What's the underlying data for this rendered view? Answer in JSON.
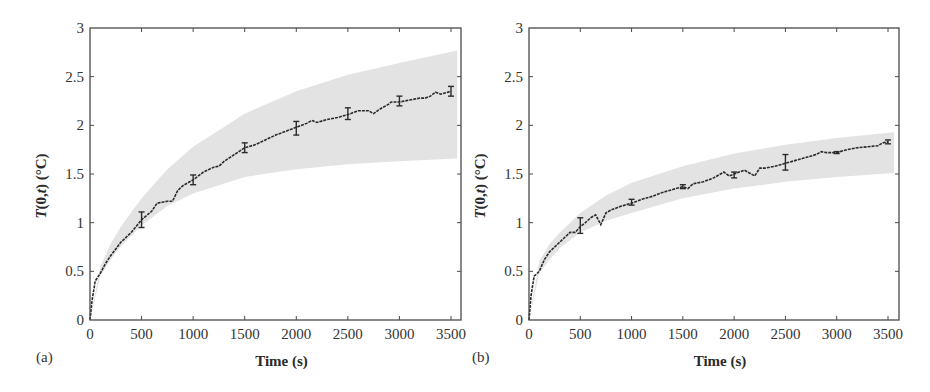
{
  "figure": {
    "panels": [
      "(a)",
      "(b)"
    ]
  },
  "chart_data": [
    {
      "type": "line",
      "panel_label": "(a)",
      "title": "",
      "xlabel": "Time (s)",
      "ylabel": "T(0,t) (°C)",
      "xlim": [
        0,
        3560
      ],
      "ylim": [
        0,
        3
      ],
      "xticks": [
        0,
        500,
        1000,
        1500,
        2000,
        2500,
        3000,
        3500
      ],
      "yticks": [
        0,
        0.5,
        1,
        1.5,
        2,
        2.5,
        3
      ],
      "ytick_labels": [
        "0",
        "0.5",
        "1",
        "1.5",
        "2",
        "2.5",
        "3"
      ],
      "grid": false,
      "legend": null,
      "series": [
        {
          "name": "measured mean",
          "style": "dashed black",
          "x": [
            0,
            20,
            50,
            100,
            150,
            200,
            300,
            400,
            500,
            600,
            650,
            700,
            750,
            800,
            850,
            900,
            1000,
            1100,
            1200,
            1250,
            1300,
            1400,
            1500,
            1600,
            1700,
            1800,
            1900,
            2000,
            2100,
            2150,
            2200,
            2300,
            2400,
            2500,
            2600,
            2700,
            2750,
            2800,
            2900,
            2920,
            3000,
            3100,
            3200,
            3250,
            3300,
            3350,
            3400,
            3500
          ],
          "y": [
            0,
            0.2,
            0.4,
            0.48,
            0.58,
            0.66,
            0.8,
            0.9,
            1.03,
            1.12,
            1.2,
            1.21,
            1.22,
            1.22,
            1.33,
            1.38,
            1.44,
            1.52,
            1.57,
            1.58,
            1.63,
            1.7,
            1.77,
            1.8,
            1.85,
            1.9,
            1.94,
            1.98,
            2.02,
            2.05,
            2.03,
            2.06,
            2.08,
            2.11,
            2.15,
            2.15,
            2.12,
            2.16,
            2.22,
            2.24,
            2.24,
            2.26,
            2.28,
            2.28,
            2.3,
            2.34,
            2.32,
            2.35
          ]
        },
        {
          "name": "uncertainty band (upper)",
          "x": [
            0,
            100,
            200,
            300,
            500,
            750,
            1000,
            1500,
            2000,
            2500,
            3000,
            3560
          ],
          "y": [
            0,
            0.55,
            0.78,
            0.96,
            1.25,
            1.55,
            1.78,
            2.12,
            2.35,
            2.52,
            2.64,
            2.77
          ]
        },
        {
          "name": "uncertainty band (lower)",
          "x": [
            0,
            100,
            200,
            300,
            500,
            750,
            1000,
            1500,
            2000,
            2500,
            3000,
            3560
          ],
          "y": [
            0,
            0.45,
            0.62,
            0.76,
            0.97,
            1.17,
            1.3,
            1.47,
            1.55,
            1.6,
            1.63,
            1.66
          ]
        }
      ],
      "error_bars": [
        {
          "x": 500,
          "y": 1.03,
          "err": 0.08
        },
        {
          "x": 1000,
          "y": 1.44,
          "err": 0.05
        },
        {
          "x": 1500,
          "y": 1.77,
          "err": 0.05
        },
        {
          "x": 2000,
          "y": 1.97,
          "err": 0.07
        },
        {
          "x": 2500,
          "y": 2.12,
          "err": 0.06
        },
        {
          "x": 3000,
          "y": 2.25,
          "err": 0.05
        },
        {
          "x": 3500,
          "y": 2.35,
          "err": 0.05
        }
      ]
    },
    {
      "type": "line",
      "panel_label": "(b)",
      "title": "",
      "xlabel": "Time (s)",
      "ylabel": "T(0,t) (°C)",
      "xlim": [
        0,
        3600
      ],
      "ylim": [
        0,
        3
      ],
      "xticks": [
        0,
        500,
        1000,
        1500,
        2000,
        2500,
        3000,
        3500
      ],
      "yticks": [
        0,
        0.5,
        1,
        1.5,
        2,
        2.5,
        3
      ],
      "ytick_labels": [
        "0",
        "0.5",
        "1",
        "1.5",
        "2",
        "2.5",
        "3"
      ],
      "grid": false,
      "legend": null,
      "series": [
        {
          "name": "measured mean",
          "style": "dashed black",
          "x": [
            0,
            20,
            50,
            100,
            150,
            200,
            300,
            350,
            400,
            450,
            500,
            550,
            600,
            650,
            700,
            750,
            800,
            900,
            1000,
            1100,
            1200,
            1300,
            1400,
            1500,
            1550,
            1600,
            1700,
            1800,
            1900,
            1950,
            2000,
            2100,
            2200,
            2250,
            2300,
            2400,
            2500,
            2600,
            2700,
            2800,
            2850,
            2900,
            3000,
            3100,
            3200,
            3300,
            3400,
            3450,
            3500
          ],
          "y": [
            0,
            0.25,
            0.45,
            0.5,
            0.62,
            0.7,
            0.8,
            0.85,
            0.9,
            0.9,
            0.96,
            1.0,
            1.05,
            1.08,
            0.98,
            1.1,
            1.13,
            1.17,
            1.2,
            1.24,
            1.27,
            1.31,
            1.34,
            1.37,
            1.35,
            1.4,
            1.42,
            1.46,
            1.52,
            1.48,
            1.5,
            1.54,
            1.48,
            1.56,
            1.56,
            1.58,
            1.61,
            1.64,
            1.67,
            1.7,
            1.73,
            1.72,
            1.72,
            1.75,
            1.77,
            1.78,
            1.79,
            1.82,
            1.83
          ]
        },
        {
          "name": "uncertainty band (upper)",
          "x": [
            0,
            100,
            200,
            300,
            500,
            750,
            1000,
            1500,
            2000,
            2500,
            3000,
            3560
          ],
          "y": [
            0,
            0.6,
            0.78,
            0.9,
            1.1,
            1.28,
            1.41,
            1.58,
            1.71,
            1.8,
            1.87,
            1.93
          ]
        },
        {
          "name": "uncertainty band (lower)",
          "x": [
            0,
            100,
            200,
            300,
            500,
            750,
            1000,
            1500,
            2000,
            2500,
            3000,
            3560
          ],
          "y": [
            0,
            0.48,
            0.62,
            0.74,
            0.9,
            1.02,
            1.1,
            1.25,
            1.35,
            1.42,
            1.47,
            1.51
          ]
        }
      ],
      "error_bars": [
        {
          "x": 500,
          "y": 0.97,
          "err": 0.08
        },
        {
          "x": 1000,
          "y": 1.21,
          "err": 0.03
        },
        {
          "x": 1500,
          "y": 1.37,
          "err": 0.02
        },
        {
          "x": 2000,
          "y": 1.49,
          "err": 0.03
        },
        {
          "x": 2500,
          "y": 1.62,
          "err": 0.08
        },
        {
          "x": 3000,
          "y": 1.72,
          "err": 0.01
        },
        {
          "x": 3500,
          "y": 1.83,
          "err": 0.02
        }
      ]
    }
  ],
  "colors": {
    "band": "#e3e3e3",
    "line": "#2b2b2b",
    "axis": "#4a4a4a"
  }
}
